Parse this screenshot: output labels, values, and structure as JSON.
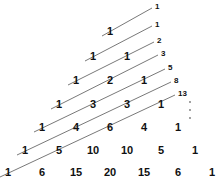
{
  "diagram": {
    "pascal_rows": [
      [
        "1"
      ],
      [
        "1",
        "1"
      ],
      [
        "1",
        "2",
        "1"
      ],
      [
        "1",
        "3",
        "3",
        "1"
      ],
      [
        "1",
        "4",
        "6",
        "4",
        "1"
      ],
      [
        "1",
        "5",
        "10",
        "10",
        "5",
        "1"
      ],
      [
        "1",
        "6",
        "15",
        "20",
        "15",
        "6",
        "1"
      ]
    ],
    "fibonacci_labels": [
      "1",
      "1",
      "2",
      "3",
      "5",
      "8",
      "13"
    ],
    "continuation": "⋮",
    "colors": {
      "text": "#111111",
      "line": "#555555",
      "background": "#ffffff"
    }
  }
}
